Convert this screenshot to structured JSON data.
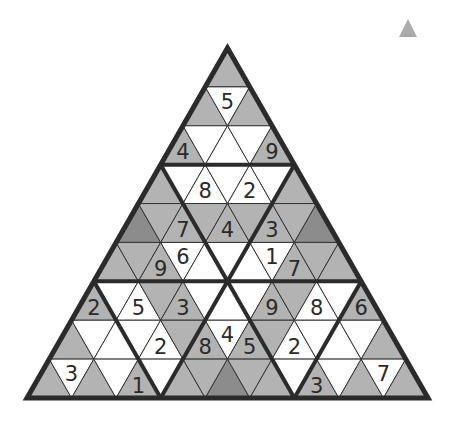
{
  "puzzle": {
    "type": "triangular-sudoku",
    "rows": 9,
    "colors": {
      "white": "#ffffff",
      "gray": "#b3b3b3",
      "dark": "#8c8c8c",
      "line": "#333333",
      "thick": "#2b2b2b",
      "digit": "#2a2a2a"
    },
    "shading": [
      "G",
      "GWG",
      "GWWWG",
      "GWWWWWG",
      "DGGGGGGGD",
      "GGGWWWWWGGG",
      "GWWGGWWWGGWWG",
      "GWWWWGGWGGWWWWG",
      "GWGWGWGGDGGWGWGWG"
    ],
    "givens": [
      {
        "row": 1,
        "col": 1,
        "value": "5"
      },
      {
        "row": 2,
        "col": 0,
        "value": "4"
      },
      {
        "row": 2,
        "col": 4,
        "value": "9"
      },
      {
        "row": 3,
        "col": 2,
        "value": "8"
      },
      {
        "row": 3,
        "col": 4,
        "value": "2"
      },
      {
        "row": 4,
        "col": 2,
        "value": "7"
      },
      {
        "row": 4,
        "col": 4,
        "value": "4"
      },
      {
        "row": 4,
        "col": 6,
        "value": "3"
      },
      {
        "row": 5,
        "col": 2,
        "value": "9"
      },
      {
        "row": 5,
        "col": 3,
        "value": "6"
      },
      {
        "row": 5,
        "col": 7,
        "value": "1"
      },
      {
        "row": 5,
        "col": 8,
        "value": "7"
      },
      {
        "row": 6,
        "col": 0,
        "value": "2"
      },
      {
        "row": 6,
        "col": 2,
        "value": "5"
      },
      {
        "row": 6,
        "col": 4,
        "value": "3"
      },
      {
        "row": 6,
        "col": 8,
        "value": "9"
      },
      {
        "row": 6,
        "col": 10,
        "value": "8"
      },
      {
        "row": 6,
        "col": 12,
        "value": "6"
      },
      {
        "row": 7,
        "col": 4,
        "value": "2"
      },
      {
        "row": 7,
        "col": 6,
        "value": "8"
      },
      {
        "row": 7,
        "col": 7,
        "value": "4"
      },
      {
        "row": 7,
        "col": 8,
        "value": "5"
      },
      {
        "row": 7,
        "col": 10,
        "value": "2"
      },
      {
        "row": 8,
        "col": 1,
        "value": "3"
      },
      {
        "row": 8,
        "col": 4,
        "value": "1"
      },
      {
        "row": 8,
        "col": 12,
        "value": "3"
      },
      {
        "row": 8,
        "col": 15,
        "value": "7"
      }
    ]
  },
  "corner_icon": "triangle-icon"
}
